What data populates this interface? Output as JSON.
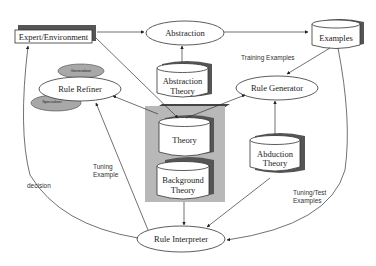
{
  "nodes": {
    "expert_environment": {
      "label": "Expert/Environment"
    },
    "abstraction": {
      "label": "Abstraction"
    },
    "examples": {
      "label": "Examples"
    },
    "abstraction_theory": {
      "line1": "Abstraction",
      "line2": "Theory"
    },
    "rule_refiner": {
      "label": "Rule Refiner"
    },
    "generalizer": {
      "label": "Generalizer"
    },
    "specializer": {
      "label": "Specializer"
    },
    "rule_generator": {
      "label": "Rule Generator"
    },
    "theory": {
      "label": "Theory"
    },
    "background_theory": {
      "line1": "Background",
      "line2": "Theory"
    },
    "abduction_theory": {
      "line1": "Abduction",
      "line2": "Theory"
    },
    "rule_interpreter": {
      "label": "Rule Interpreter"
    }
  },
  "edge_labels": {
    "training_examples": "Training Examples",
    "tuning_example_1": "Tuning",
    "tuning_example_2": "Example",
    "decision": "decision",
    "tuning_test_1": "Tuning/Test",
    "tuning_test_2": "Examples"
  },
  "colors": {
    "stroke": "#333333",
    "shadow": "#555555",
    "panel": "#b8b8b8",
    "grey_ellipse": "#a8a8a8"
  }
}
